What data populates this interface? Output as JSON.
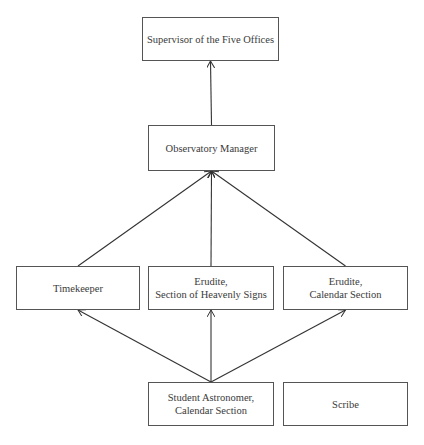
{
  "diagram": {
    "type": "org-chart",
    "nodes": [
      {
        "id": "supervisor",
        "label": "Supervisor of the Five Offices",
        "x": 142,
        "y": 17,
        "w": 137,
        "h": 44
      },
      {
        "id": "observatory_manager",
        "label": "Observatory Manager",
        "x": 148,
        "y": 125,
        "w": 127,
        "h": 46
      },
      {
        "id": "timekeeper",
        "label": "Timekeeper",
        "x": 16,
        "y": 266,
        "w": 124,
        "h": 44
      },
      {
        "id": "erudite_heavenly",
        "label": "Erudite,\nSection of Heavenly Signs",
        "x": 148,
        "y": 266,
        "w": 126,
        "h": 44
      },
      {
        "id": "erudite_calendar",
        "label": "Erudite,\nCalendar Section",
        "x": 283,
        "y": 266,
        "w": 125,
        "h": 44
      },
      {
        "id": "student_astronomer",
        "label": "Student Astronomer,\nCalendar Section",
        "x": 148,
        "y": 382,
        "w": 126,
        "h": 44
      },
      {
        "id": "scribe",
        "label": "Scribe",
        "x": 283,
        "y": 382,
        "w": 125,
        "h": 44
      }
    ],
    "edges": [
      {
        "from": "observatory_manager",
        "to": "supervisor"
      },
      {
        "from": "timekeeper",
        "to": "observatory_manager"
      },
      {
        "from": "erudite_heavenly",
        "to": "observatory_manager"
      },
      {
        "from": "erudite_calendar",
        "to": "observatory_manager"
      },
      {
        "from": "student_astronomer",
        "to": "timekeeper"
      },
      {
        "from": "student_astronomer",
        "to": "erudite_heavenly"
      },
      {
        "from": "student_astronomer",
        "to": "erudite_calendar"
      }
    ]
  }
}
